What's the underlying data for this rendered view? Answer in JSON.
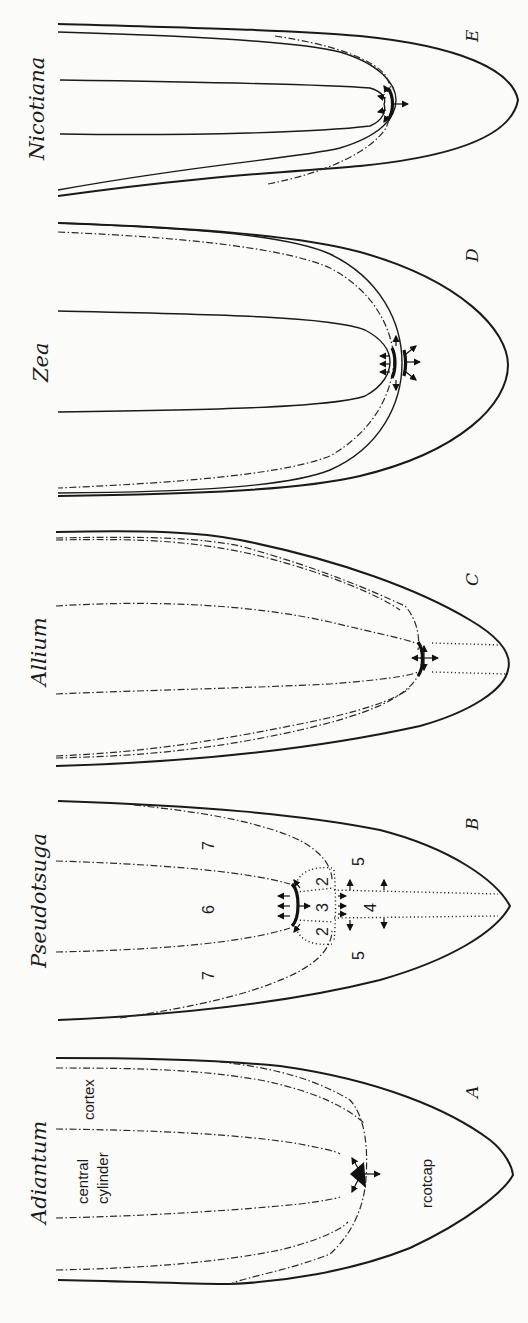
{
  "figure": {
    "orientation": "rotated-90-ccw",
    "panels": [
      {
        "letter": "A",
        "genus": "Adiantum",
        "region_labels": {
          "central_cylinder_1": "central",
          "central_cylinder_2": "cylinder",
          "cortex": "cortex",
          "rootcap": "rcotcap"
        },
        "initial": "apical cell (tetrahedral)"
      },
      {
        "letter": "B",
        "genus": "Pseudotsuga",
        "zone_numbers": [
          "7",
          "6",
          "7",
          "2",
          "3",
          "2",
          "5",
          "4",
          "5"
        ]
      },
      {
        "letter": "C",
        "genus": "Allium"
      },
      {
        "letter": "D",
        "genus": "Zea"
      },
      {
        "letter": "E",
        "genus": "Nicotiana"
      }
    ],
    "line_styles": {
      "outline": "solid",
      "tissue_boundaries": "dash-dot",
      "columella": "dotted"
    },
    "colors": {
      "ink": "#1a1a1a",
      "paper": "#fbfbf9"
    }
  }
}
